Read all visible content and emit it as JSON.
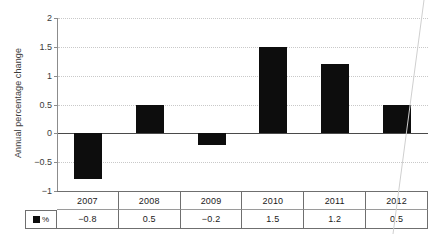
{
  "chart_data": {
    "type": "bar",
    "title": "",
    "subtitle": "",
    "xlabel": "",
    "ylabel": "Annual percentage change",
    "categories": [
      "2007",
      "2008",
      "2009",
      "2010",
      "2011",
      "2012"
    ],
    "values": [
      -0.8,
      0.5,
      -0.2,
      1.5,
      1.2,
      0.5
    ],
    "value_labels": [
      "−0.8",
      "0.5",
      "−0.2",
      "1.5",
      "1.2",
      "0.5"
    ],
    "series": [
      {
        "name": "%",
        "values": [
          -0.8,
          0.5,
          -0.2,
          1.5,
          1.2,
          0.5
        ],
        "color": "#0d0d0d"
      }
    ],
    "ylim": [
      -1,
      2
    ],
    "yticks": [
      2,
      1.5,
      1,
      0.5,
      0,
      -0.5,
      -1
    ],
    "ytick_labels": [
      "2",
      "1.5",
      "1",
      "0.5",
      "0",
      "−0.5",
      "−1"
    ],
    "grid": true,
    "grid_style": "dotted",
    "legend_position": "table-row-header",
    "bar_color": "#0d0d0d"
  },
  "axis": {
    "y_title": "Annual percentage change"
  },
  "legend": {
    "marker": "filled-square",
    "label": "%"
  },
  "table": {
    "header_row": [
      "2007",
      "2008",
      "2009",
      "2010",
      "2011",
      "2012"
    ],
    "value_row": [
      "−0.8",
      "0.5",
      "−0.2",
      "1.5",
      "1.2",
      "0.5"
    ],
    "row_header": "%"
  },
  "colors": {
    "bar": "#0d0d0d",
    "grid": "#c9c9c9",
    "axis": "#8c8c8c",
    "zero_line": "#4a4a4a",
    "table_border": "#6f6f6f",
    "text": "#1a1a1a"
  }
}
